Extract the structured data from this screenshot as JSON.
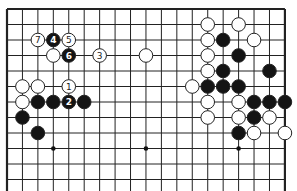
{
  "board": {
    "columns": 19,
    "visible_rows": 12,
    "origin_x": 7,
    "origin_y": 9,
    "spacing_x": 15.44,
    "spacing_y": 15.5,
    "line_color": "#222222",
    "edges": [
      "top",
      "left",
      "right"
    ],
    "star_points": [
      [
        3,
        9
      ],
      [
        9,
        9
      ],
      [
        15,
        9
      ]
    ]
  },
  "stones": [
    {
      "color": "white",
      "col": 2,
      "row": 2,
      "label": "7"
    },
    {
      "color": "black",
      "col": 3,
      "row": 2,
      "label": "4"
    },
    {
      "color": "white",
      "col": 4,
      "row": 2,
      "label": "5"
    },
    {
      "color": "white",
      "col": 3,
      "row": 3,
      "label": ""
    },
    {
      "color": "black",
      "col": 4,
      "row": 3,
      "label": "6"
    },
    {
      "color": "white",
      "col": 6,
      "row": 3,
      "label": "3"
    },
    {
      "color": "white",
      "col": 9,
      "row": 3,
      "label": ""
    },
    {
      "color": "white",
      "col": 1,
      "row": 5,
      "label": ""
    },
    {
      "color": "white",
      "col": 2,
      "row": 5,
      "label": ""
    },
    {
      "color": "white",
      "col": 4,
      "row": 5,
      "label": "1"
    },
    {
      "color": "white",
      "col": 1,
      "row": 6,
      "label": ""
    },
    {
      "color": "black",
      "col": 2,
      "row": 6,
      "label": ""
    },
    {
      "color": "black",
      "col": 3,
      "row": 6,
      "label": ""
    },
    {
      "color": "black",
      "col": 4,
      "row": 6,
      "label": "2"
    },
    {
      "color": "black",
      "col": 5,
      "row": 6,
      "label": ""
    },
    {
      "color": "black",
      "col": 1,
      "row": 7,
      "label": ""
    },
    {
      "color": "black",
      "col": 2,
      "row": 8,
      "label": ""
    },
    {
      "color": "white",
      "col": 13,
      "row": 1,
      "label": ""
    },
    {
      "color": "white",
      "col": 15,
      "row": 1,
      "label": ""
    },
    {
      "color": "white",
      "col": 13,
      "row": 2,
      "label": ""
    },
    {
      "color": "black",
      "col": 14,
      "row": 2,
      "label": ""
    },
    {
      "color": "white",
      "col": 16,
      "row": 2,
      "label": ""
    },
    {
      "color": "white",
      "col": 13,
      "row": 3,
      "label": ""
    },
    {
      "color": "black",
      "col": 15,
      "row": 3,
      "label": ""
    },
    {
      "color": "white",
      "col": 13,
      "row": 4,
      "label": ""
    },
    {
      "color": "black",
      "col": 14,
      "row": 4,
      "label": ""
    },
    {
      "color": "black",
      "col": 17,
      "row": 4,
      "label": ""
    },
    {
      "color": "white",
      "col": 12,
      "row": 5,
      "label": ""
    },
    {
      "color": "black",
      "col": 13,
      "row": 5,
      "label": ""
    },
    {
      "color": "black",
      "col": 14,
      "row": 5,
      "label": ""
    },
    {
      "color": "black",
      "col": 15,
      "row": 5,
      "label": ""
    },
    {
      "color": "white",
      "col": 13,
      "row": 6,
      "label": ""
    },
    {
      "color": "white",
      "col": 15,
      "row": 6,
      "label": ""
    },
    {
      "color": "black",
      "col": 16,
      "row": 6,
      "label": ""
    },
    {
      "color": "black",
      "col": 17,
      "row": 6,
      "label": ""
    },
    {
      "color": "black",
      "col": 18,
      "row": 6,
      "label": ""
    },
    {
      "color": "white",
      "col": 13,
      "row": 7,
      "label": ""
    },
    {
      "color": "white",
      "col": 15,
      "row": 7,
      "label": ""
    },
    {
      "color": "black",
      "col": 16,
      "row": 7,
      "label": ""
    },
    {
      "color": "white",
      "col": 17,
      "row": 7,
      "label": ""
    },
    {
      "color": "black",
      "col": 15,
      "row": 8,
      "label": ""
    },
    {
      "color": "white",
      "col": 16,
      "row": 8,
      "label": ""
    },
    {
      "color": "white",
      "col": 18,
      "row": 8,
      "label": ""
    }
  ]
}
